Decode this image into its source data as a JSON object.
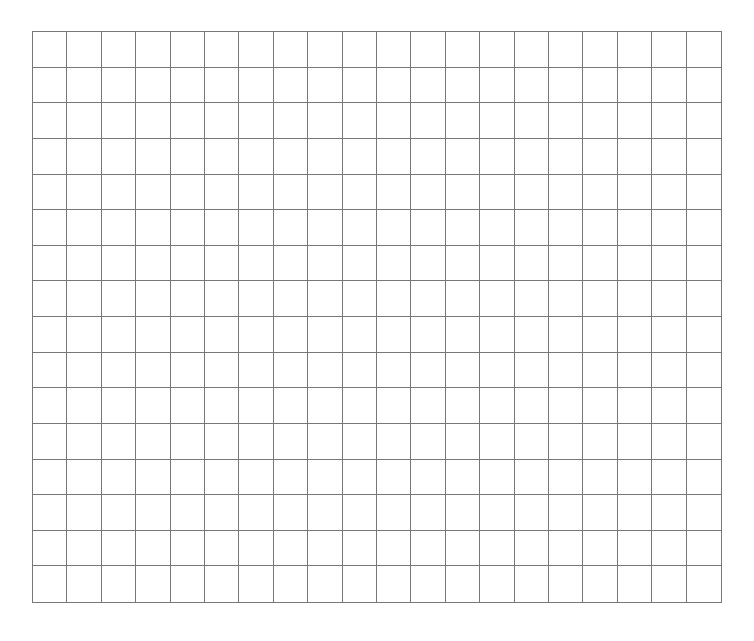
{
  "grid": {
    "columns": 20,
    "rows": 16,
    "line_color": "#777777",
    "background_color": "#ffffff",
    "cells_filled": []
  }
}
